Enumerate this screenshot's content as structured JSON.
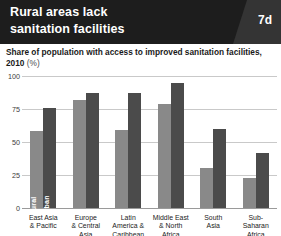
{
  "header": {
    "title_lines": [
      "Rural areas lack",
      "sanitation facilities"
    ],
    "badge": "7d",
    "background_color": "#1d1d1d",
    "badge_color": "#343434"
  },
  "subtitle": {
    "text": "Share of population with access to improved sanitation facilities,",
    "text_line2": "2010",
    "unit": "(%)"
  },
  "colors": {
    "rural": "#898989",
    "urban": "#4b4b4b",
    "gridline": "#c9c9c9"
  },
  "chart_data": {
    "type": "bar",
    "title": "Rural areas lack sanitation facilities",
    "subtitle": "Share of population with access to improved sanitation facilities, 2010 (%)",
    "xlabel": "",
    "ylabel": "",
    "ylim": [
      0,
      100
    ],
    "yticks": [
      0,
      25,
      50,
      75,
      100
    ],
    "ytick_labels": [
      "0",
      "25",
      "50",
      "75",
      "100"
    ],
    "grid": true,
    "legend_position": "inline-first-group",
    "categories": [
      {
        "lines": [
          "East Asia",
          "& Pacific"
        ]
      },
      {
        "lines": [
          "Europe",
          "& Central",
          "Asia"
        ]
      },
      {
        "lines": [
          "Latin",
          "America &",
          "Caribbean"
        ]
      },
      {
        "lines": [
          "Middle East",
          "& North",
          "Africa"
        ]
      },
      {
        "lines": [
          "South",
          "Asia"
        ]
      },
      {
        "lines": [
          "Sub-Saharan",
          "Africa"
        ]
      }
    ],
    "category_labels": [
      "East Asia & Pacific",
      "Europe & Central Asia",
      "Latin America & Caribbean",
      "Middle East & North Africa",
      "South Asia",
      "Sub-Saharan Africa"
    ],
    "series": [
      {
        "name": "Rural",
        "color": "#898989",
        "values": [
          58,
          82,
          59,
          79,
          30,
          23
        ]
      },
      {
        "name": "Urban",
        "color": "#4b4b4b",
        "values": [
          76,
          87,
          87,
          95,
          60,
          42
        ]
      }
    ]
  }
}
